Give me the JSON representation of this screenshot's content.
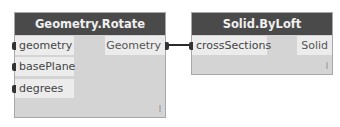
{
  "nodes": [
    {
      "title": "Geometry.Rotate",
      "inputs": [
        "geometry",
        "basePlane",
        "degrees"
      ],
      "outputs": [
        "Geometry"
      ],
      "lacing": "I"
    },
    {
      "title": "Solid.ByLoft",
      "inputs": [
        "crossSections"
      ],
      "outputs": [
        "Solid"
      ],
      "lacing": "I"
    }
  ],
  "connections": [
    {
      "from": "Geometry.Rotate.Geometry",
      "to": "Solid.ByLoft.crossSections"
    }
  ]
}
